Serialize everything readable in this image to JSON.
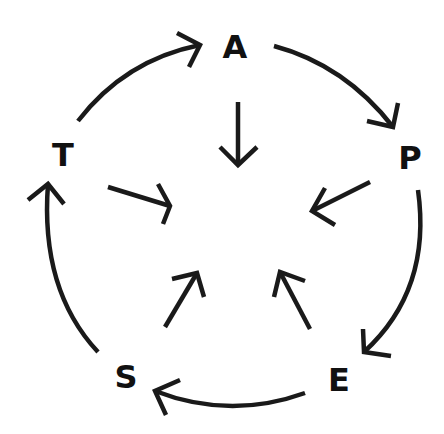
{
  "diagram": {
    "type": "cycle",
    "stroke_color": "#1a1a1a",
    "text_color": "#111111",
    "background": "#ffffff",
    "nodes": [
      {
        "id": "A",
        "label": "A"
      },
      {
        "id": "P",
        "label": "P"
      },
      {
        "id": "E",
        "label": "E"
      },
      {
        "id": "S",
        "label": "S"
      },
      {
        "id": "T",
        "label": "T"
      }
    ],
    "outer_edges": [
      {
        "from": "T",
        "to": "A"
      },
      {
        "from": "A",
        "to": "P"
      },
      {
        "from": "P",
        "to": "E"
      },
      {
        "from": "E",
        "to": "S"
      },
      {
        "from": "S",
        "to": "T"
      }
    ],
    "inner_edges": [
      {
        "from": "A",
        "to": "center"
      },
      {
        "from": "P",
        "to": "center"
      },
      {
        "from": "E",
        "to": "center"
      },
      {
        "from": "S",
        "to": "center"
      },
      {
        "from": "T",
        "to": "center"
      }
    ]
  }
}
